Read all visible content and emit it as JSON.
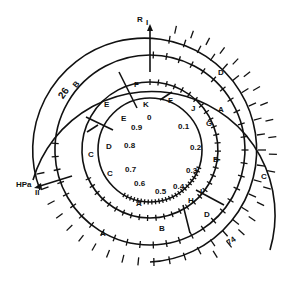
{
  "diagram": {
    "type": "circular-map",
    "center": {
      "x": 150,
      "y": 150
    },
    "axes": {
      "vertical": {
        "label": "R",
        "roman": "I"
      },
      "horizontal": {
        "label": "HPa",
        "roman": "II"
      }
    },
    "outer_labels": {
      "left_top_number": "26",
      "right_bottom_number": "74"
    },
    "rings": [
      {
        "name": "inner-scale",
        "radius": 52,
        "scale_labels": [
          "0",
          "0.1",
          "0.2",
          "0.3",
          "0.4",
          "0.5",
          "0.6",
          "0.7",
          "0.8",
          "0.9"
        ]
      },
      {
        "name": "ring-2",
        "radius": 68,
        "letters": [
          "F",
          "J",
          "G",
          "B",
          "I",
          "H",
          "A",
          "C",
          "D",
          "E",
          "K"
        ]
      },
      {
        "name": "ring-3",
        "radius": 95,
        "letters": [
          "F",
          "A",
          "B",
          "D",
          "B",
          "C",
          "D",
          "E"
        ]
      },
      {
        "name": "ring-4",
        "radius": 110,
        "letters": [
          "D",
          "C",
          "A",
          "B"
        ]
      },
      {
        "name": "ring-5",
        "radius": 123,
        "letters": []
      }
    ]
  },
  "labels": {
    "R": "R",
    "I": "I",
    "HPa": "HPa",
    "II": "II",
    "n26": "26",
    "n74": "74",
    "s0": "0",
    "s01": "0.1",
    "s02": "0.2",
    "s03": "0.3",
    "s04": "0.4",
    "s05": "0.5",
    "s06": "0.6",
    "s07": "0.7",
    "s08": "0.8",
    "s09": "0.9",
    "r2_F": "F",
    "r2_J": "J",
    "r2_G": "G",
    "r2_B": "B",
    "r2_I": "I",
    "r2_H": "H",
    "r2_A": "A",
    "r2_C": "C",
    "r2_D": "D",
    "r2_E": "E",
    "r2_K": "K",
    "r3_F": "F",
    "r3_A": "A",
    "r3_B": "B",
    "r3_D": "D",
    "r3_B2": "B",
    "r3_C": "C",
    "r3_E": "E",
    "r4_D": "D",
    "r4_C": "C",
    "r4_A": "A",
    "r4_B": "B"
  }
}
